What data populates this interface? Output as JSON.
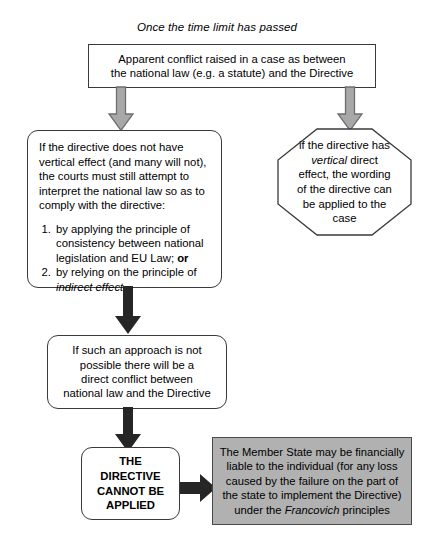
{
  "caption": "Once the time limit has passed",
  "nodes": {
    "apparent_conflict": {
      "line1": "Apparent conflict raised in a case as between",
      "line2": "the national law (e.g. a statute) and the Directive"
    },
    "interpret": {
      "paragraph": "If the directive does not have vertical effect (and many will not), the courts must still attempt to interpret the national law so as to comply with the directive:",
      "items": [
        {
          "text_before": "by applying the principle of consistency between national legislation and EU Law;",
          "emphasis_bold": "or",
          "emphasis_italic": ""
        },
        {
          "text_before": "by relying on the principle of",
          "emphasis_bold": "",
          "emphasis_italic": "indirect effect"
        }
      ]
    },
    "vertical_effect": {
      "part1": "if the directive has ",
      "italic": "vertical",
      "part2": " direct effect, the wording of the directive can be applied to the case"
    },
    "direct_conflict": {
      "line1": "If such an approach is not",
      "line2": "possible there will be a",
      "line3": "direct conflict between",
      "line4": "national law and the Directive"
    },
    "cannot_be_applied": {
      "line1": "THE",
      "line2": "DIRECTIVE",
      "line3": "CANNOT BE",
      "line4": "APPLIED"
    },
    "member_state": {
      "part1": "The Member State may be financially liable to the individual (for any loss caused by the failure on the part of the state to implement the Directive) under the ",
      "italic": "Francovich",
      "part2": " principles"
    }
  },
  "colors": {
    "gray_arrow_fill": "#a8a8a8",
    "gray_arrow_stroke": "#6e6e6e",
    "black_arrow": "#262626",
    "gray_box_fill": "#b1b1b1",
    "box_border": "#3a3a3a",
    "text": "#000000"
  },
  "arrows": [
    {
      "name": "gray-arrow-to-interpret",
      "direction": "down",
      "style": "gray-outline"
    },
    {
      "name": "gray-arrow-to-vertical-effect",
      "direction": "down",
      "style": "gray-outline"
    },
    {
      "name": "black-arrow-to-direct-conflict",
      "direction": "down",
      "style": "solid-black"
    },
    {
      "name": "black-arrow-to-cannot-be-applied",
      "direction": "down",
      "style": "solid-black"
    },
    {
      "name": "black-arrow-to-member-state",
      "direction": "right",
      "style": "solid-black"
    }
  ]
}
